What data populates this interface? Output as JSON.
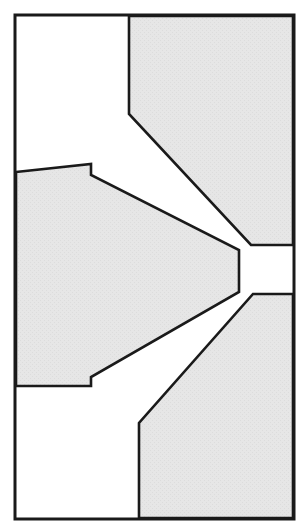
{
  "figure": {
    "title": "Cross-sectional line drawing of a two-part extrusion die with a central tapered wedge and narrow throat channel",
    "kind": "technical-cross-section-diagram",
    "canvas": {
      "width": 307,
      "height": 527
    },
    "colors": {
      "background": "#ffffff",
      "hatch_fill": "#e4e4e4",
      "outline": "#1a1a1a",
      "frame": "#1a1a1a"
    },
    "stroke_widths": {
      "frame": 3,
      "part_outline": 2.6
    },
    "frame": {
      "name": "outer-border-rectangle",
      "x": 15,
      "y": 15,
      "width": 279,
      "height": 504
    },
    "parts": [
      {
        "name": "upper-right-die-block",
        "label": "Upper right die half",
        "fill": "#e4e4e4",
        "points": "129,16 293,16 293,245 251,245 129,114"
      },
      {
        "name": "lower-right-die-block",
        "label": "Lower right die half",
        "fill": "#e4e4e4",
        "points": "293,294 293,518 139,518 139,423 253,294"
      },
      {
        "name": "central-tapered-wedge",
        "label": "Central tapered core wedge",
        "fill": "#e4e4e4",
        "points": "16,172 91,164 91,175 239,250 239,292 91,377 91,386 16,386"
      }
    ],
    "features": [
      {
        "name": "throat-channel-upper-edge",
        "description": "Horizontal upper boundary of the narrow throat channel",
        "y": 245
      },
      {
        "name": "throat-channel-lower-edge",
        "description": "Horizontal lower boundary of the narrow throat channel",
        "y": 294
      },
      {
        "name": "wedge-tip-face",
        "description": "Vertical blunt tip face of the central wedge",
        "x": 239,
        "y_top": 250,
        "y_bottom": 292
      },
      {
        "name": "throat-gap-height",
        "value": 49
      }
    ]
  }
}
